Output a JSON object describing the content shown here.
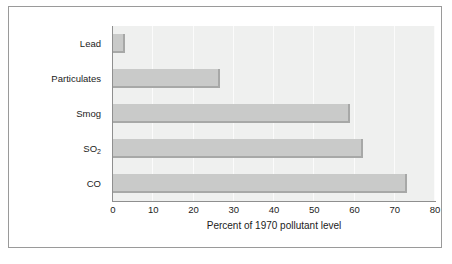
{
  "chart_data": {
    "type": "bar",
    "orientation": "horizontal",
    "title": "",
    "xlabel": "Percent of 1970 pollutant level",
    "ylabel": "",
    "categories": [
      "Lead",
      "Particulates",
      "Smog",
      "SO2",
      "CO"
    ],
    "category_labels_display": [
      "Lead",
      "Particulates",
      "Smog",
      "SO₂",
      "CO"
    ],
    "values": [
      3,
      26.5,
      59,
      62,
      73
    ],
    "xlim": [
      0,
      80
    ],
    "ylim": null,
    "xticks": [
      0,
      10,
      20,
      30,
      40,
      50,
      60,
      70,
      80
    ],
    "xtick_labels": [
      "0",
      "10",
      "20",
      "30",
      "40",
      "50",
      "60",
      "70",
      "80"
    ],
    "grid": true,
    "grid_axis": "x",
    "legend": null,
    "legend_position": "none",
    "annotations": [],
    "series": [
      {
        "name": "Percent of 1970 pollutant level",
        "values": [
          3,
          26.5,
          59,
          62,
          73
        ]
      }
    ]
  },
  "colors": {
    "bar_fill": "#c9cac9",
    "bar_shadow": "#a7a8a7",
    "plot_background": "#eff0ef",
    "gridline": "#fbfbfb",
    "axis_line": "#8f8f8f",
    "frame_border": "#9a9a9a",
    "figure_background": "#ffffff",
    "text": "#1b1b1b"
  },
  "axis": {
    "x_title": "Percent of 1970 pollutant level",
    "ticks": [
      {
        "label": "0",
        "value": 0
      },
      {
        "label": "10",
        "value": 10
      },
      {
        "label": "20",
        "value": 20
      },
      {
        "label": "30",
        "value": 30
      },
      {
        "label": "40",
        "value": 40
      },
      {
        "label": "50",
        "value": 50
      },
      {
        "label": "60",
        "value": 60
      },
      {
        "label": "70",
        "value": 70
      },
      {
        "label": "80",
        "value": 80
      }
    ]
  },
  "rows": [
    {
      "label": "Lead",
      "label_html": "Lead",
      "value": 3
    },
    {
      "label": "Particulates",
      "label_html": "Particulates",
      "value": 26.5
    },
    {
      "label": "Smog",
      "label_html": "Smog",
      "value": 59
    },
    {
      "label": "SO2",
      "label_html": "SO",
      "sub": "2",
      "value": 62
    },
    {
      "label": "CO",
      "label_html": "CO",
      "value": 73
    }
  ]
}
